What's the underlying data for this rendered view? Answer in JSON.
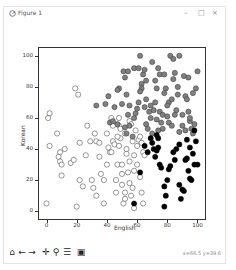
{
  "window": {
    "title": "Figure 1",
    "controls": {
      "minimize": "–",
      "maximize": "□",
      "close": "×"
    }
  },
  "toolbar": {
    "buttons": [
      {
        "name": "home-icon",
        "glyph": "⌂"
      },
      {
        "name": "back-arrow-icon",
        "glyph": "←"
      },
      {
        "name": "forward-arrow-icon",
        "glyph": "→"
      },
      {
        "name": "pan-icon",
        "glyph": "✛"
      },
      {
        "name": "zoom-icon",
        "glyph": "⚲"
      },
      {
        "name": "configure-subplots-icon",
        "glyph": "☰"
      },
      {
        "name": "save-icon",
        "glyph": "▣"
      }
    ],
    "status": "x=66.5 y=39.6"
  },
  "chart_data": {
    "type": "scatter",
    "title": "",
    "xlabel": "English",
    "ylabel": "Korean",
    "xlim": [
      -5,
      105
    ],
    "ylim": [
      -5,
      105
    ],
    "xticks": [
      0,
      20,
      40,
      60,
      80,
      100
    ],
    "yticks": [
      0,
      20,
      40,
      60,
      80,
      100
    ],
    "grid": false,
    "legend": null,
    "series": [
      {
        "name": "cluster-white",
        "color": "#ffffff",
        "edgecolor": "#333333",
        "points": [
          [
            2,
            63
          ],
          [
            2,
            42
          ],
          [
            19,
            79
          ],
          [
            21,
            75
          ],
          [
            1,
            60
          ],
          [
            7,
            50
          ],
          [
            0,
            5
          ],
          [
            20,
            3
          ],
          [
            22,
            44
          ],
          [
            26,
            36
          ],
          [
            32,
            50
          ],
          [
            33,
            45
          ],
          [
            35,
            44
          ],
          [
            36,
            24
          ],
          [
            38,
            20
          ],
          [
            40,
            30
          ],
          [
            42,
            38
          ],
          [
            43,
            38
          ],
          [
            44,
            45
          ],
          [
            45,
            43
          ],
          [
            46,
            12
          ],
          [
            46,
            20
          ],
          [
            47,
            30
          ],
          [
            48,
            60
          ],
          [
            48,
            55
          ],
          [
            48,
            42
          ],
          [
            49,
            53
          ],
          [
            49,
            47
          ],
          [
            50,
            30
          ],
          [
            50,
            24
          ],
          [
            50,
            17
          ],
          [
            51,
            5
          ],
          [
            52,
            8
          ],
          [
            53,
            37
          ],
          [
            53,
            40
          ],
          [
            54,
            25
          ],
          [
            55,
            32
          ],
          [
            56,
            10
          ],
          [
            57,
            15
          ],
          [
            57,
            45
          ],
          [
            58,
            2
          ],
          [
            58,
            36
          ],
          [
            60,
            42
          ],
          [
            61,
            46
          ],
          [
            12,
            40
          ],
          [
            8,
            35
          ],
          [
            9,
            38
          ],
          [
            10,
            23
          ],
          [
            16,
            31
          ],
          [
            18,
            33
          ],
          [
            27,
            55
          ],
          [
            29,
            45
          ],
          [
            30,
            20
          ],
          [
            31,
            15
          ],
          [
            33,
            10
          ],
          [
            35,
            35
          ],
          [
            38,
            5
          ],
          [
            40,
            50
          ],
          [
            43,
            60
          ],
          [
            44,
            55
          ],
          [
            9,
            32
          ],
          [
            10,
            30
          ],
          [
            22,
            20
          ],
          [
            24,
            16
          ],
          [
            41,
            41
          ],
          [
            47,
            48
          ],
          [
            52,
            50
          ],
          [
            55,
            58
          ],
          [
            56,
            56
          ],
          [
            59,
            52
          ],
          [
            62,
            48
          ],
          [
            63,
            44
          ],
          [
            64,
            38
          ],
          [
            65,
            36
          ],
          [
            60,
            30
          ],
          [
            58,
            26
          ],
          [
            62,
            22
          ],
          [
            55,
            18
          ],
          [
            52,
            12
          ],
          [
            63,
            12
          ],
          [
            64,
            5
          ]
        ]
      },
      {
        "name": "cluster-gray",
        "color": "#808080",
        "edgecolor": "#333333",
        "points": [
          [
            52,
            86
          ],
          [
            62,
            100
          ],
          [
            58,
            92
          ],
          [
            51,
            90
          ],
          [
            54,
            90
          ],
          [
            41,
            74
          ],
          [
            33,
            68
          ],
          [
            39,
            69
          ],
          [
            45,
            67
          ],
          [
            50,
            69
          ],
          [
            54,
            62
          ],
          [
            55,
            68
          ],
          [
            53,
            75
          ],
          [
            48,
            79
          ],
          [
            47,
            78
          ],
          [
            42,
            57
          ],
          [
            44,
            58
          ],
          [
            47,
            56
          ],
          [
            52,
            54
          ],
          [
            53,
            50
          ],
          [
            55,
            55
          ],
          [
            57,
            48
          ],
          [
            58,
            60
          ],
          [
            59,
            63
          ],
          [
            60,
            66
          ],
          [
            61,
            70
          ],
          [
            61,
            92
          ],
          [
            63,
            82
          ],
          [
            63,
            79
          ],
          [
            64,
            88
          ],
          [
            65,
            91
          ],
          [
            65,
            67
          ],
          [
            66,
            72
          ],
          [
            66,
            56
          ],
          [
            67,
            53
          ],
          [
            68,
            64
          ],
          [
            69,
            68
          ],
          [
            69,
            60
          ],
          [
            70,
            50
          ],
          [
            71,
            65
          ],
          [
            72,
            70
          ],
          [
            72,
            84
          ],
          [
            73,
            79
          ],
          [
            73,
            59
          ],
          [
            74,
            52
          ],
          [
            75,
            88
          ],
          [
            75,
            64
          ],
          [
            76,
            57
          ],
          [
            77,
            53
          ],
          [
            77,
            62
          ],
          [
            78,
            76
          ],
          [
            79,
            79
          ],
          [
            80,
            61
          ],
          [
            81,
            57
          ],
          [
            81,
            70
          ],
          [
            83,
            55
          ],
          [
            83,
            72
          ],
          [
            84,
            85
          ],
          [
            85,
            89
          ],
          [
            86,
            65
          ],
          [
            87,
            80
          ],
          [
            87,
            75
          ],
          [
            88,
            51
          ],
          [
            88,
            100
          ],
          [
            90,
            62
          ],
          [
            91,
            87
          ],
          [
            92,
            74
          ],
          [
            93,
            72
          ],
          [
            94,
            64
          ],
          [
            94,
            86
          ],
          [
            95,
            58
          ],
          [
            96,
            53
          ],
          [
            97,
            50
          ],
          [
            97,
            76
          ],
          [
            98,
            56
          ],
          [
            99,
            79
          ],
          [
            82,
            100
          ],
          [
            84,
            98
          ],
          [
            70,
            96
          ],
          [
            74,
            92
          ],
          [
            78,
            88
          ],
          [
            66,
            84
          ],
          [
            62,
            77
          ],
          [
            80,
            68
          ],
          [
            85,
            62
          ],
          [
            90,
            55
          ],
          [
            92,
            52
          ],
          [
            95,
            60
          ],
          [
            100,
            90
          ]
        ]
      },
      {
        "name": "cluster-black",
        "color": "#000000",
        "edgecolor": "#000000",
        "points": [
          [
            58,
            5
          ],
          [
            62,
            25
          ],
          [
            65,
            42
          ],
          [
            67,
            38
          ],
          [
            69,
            47
          ],
          [
            71,
            40
          ],
          [
            72,
            35
          ],
          [
            73,
            49
          ],
          [
            73,
            39
          ],
          [
            74,
            41
          ],
          [
            74,
            47
          ],
          [
            75,
            30
          ],
          [
            76,
            28
          ],
          [
            78,
            16
          ],
          [
            79,
            10
          ],
          [
            80,
            20
          ],
          [
            81,
            27
          ],
          [
            82,
            29
          ],
          [
            84,
            38
          ],
          [
            85,
            33
          ],
          [
            86,
            40
          ],
          [
            88,
            17
          ],
          [
            89,
            8
          ],
          [
            90,
            14
          ],
          [
            91,
            13
          ],
          [
            92,
            33
          ],
          [
            93,
            34
          ],
          [
            93,
            46
          ],
          [
            94,
            26
          ],
          [
            95,
            21
          ],
          [
            96,
            20
          ],
          [
            97,
            37
          ],
          [
            98,
            30
          ],
          [
            98,
            52
          ],
          [
            99,
            45
          ],
          [
            100,
            30
          ],
          [
            78,
            3
          ],
          [
            70,
            44
          ],
          [
            88,
            43
          ],
          [
            95,
            41
          ]
        ]
      }
    ]
  }
}
